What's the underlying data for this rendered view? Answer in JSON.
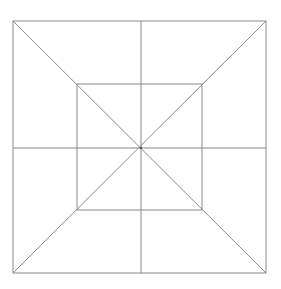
{
  "diagram": {
    "stroke_color": "#8a8a8a",
    "background": "#ffffff",
    "outer_square": {
      "x1": 13,
      "y1": 21,
      "x2": 266,
      "y2": 273
    },
    "inner_square": {
      "x1": 77,
      "y1": 84,
      "x2": 202,
      "y2": 210
    },
    "center": {
      "x": 141,
      "y": 148
    }
  }
}
